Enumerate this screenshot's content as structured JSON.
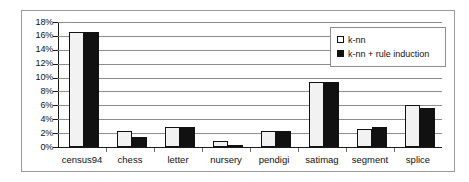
{
  "chart_data": {
    "type": "bar",
    "title": "",
    "xlabel": "",
    "ylabel": "",
    "ylim": [
      0,
      18
    ],
    "ytick_values": [
      0,
      2,
      4,
      6,
      8,
      10,
      12,
      14,
      16,
      18
    ],
    "ytick_labels": [
      "0%",
      "2%",
      "4%",
      "6%",
      "8%",
      "10%",
      "12%",
      "14%",
      "16%",
      "18%"
    ],
    "grid": true,
    "legend_position": "top-right",
    "categories": [
      "census94",
      "chess",
      "letter",
      "nursery",
      "pendigi",
      "satimag",
      "segment",
      "splice"
    ],
    "series": [
      {
        "name": "k-nn",
        "swatch": "hollow-square",
        "color": "#f2f2f2",
        "values": [
          16.5,
          2.3,
          2.9,
          0.8,
          2.35,
          9.35,
          2.65,
          6.0
        ]
      },
      {
        "name": "k-nn + rule induction",
        "swatch": "filled-square",
        "color": "#111111",
        "values": [
          16.5,
          1.5,
          2.85,
          0.3,
          2.3,
          9.3,
          2.85,
          5.65
        ]
      }
    ]
  },
  "legend": {
    "entries": [
      {
        "label": "k-nn"
      },
      {
        "label": "k-nn + rule induction"
      }
    ]
  }
}
